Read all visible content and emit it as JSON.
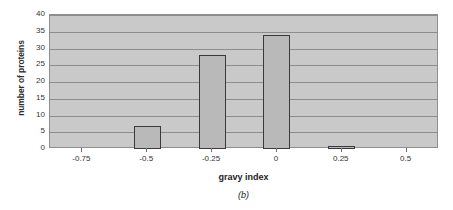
{
  "chart_data": {
    "type": "bar",
    "title": "",
    "xlabel": "gravy index",
    "ylabel": "number of proteins",
    "categories": [
      "-0.75",
      "-0.5",
      "-0.25",
      "0",
      "0.25",
      "0.5"
    ],
    "values": [
      0,
      7,
      28,
      34,
      1,
      0
    ],
    "bars": [
      {
        "category": "-0.5",
        "value": 7
      },
      {
        "category": "-0.25",
        "value": 28
      },
      {
        "category": "0",
        "value": 34
      },
      {
        "category": "0.25",
        "value": 1
      }
    ],
    "ylim": [
      0,
      40
    ],
    "ytick_labels": [
      "40",
      "35",
      "30",
      "25",
      "20",
      "15",
      "10",
      "5",
      "0"
    ],
    "ytick_values": [
      40,
      35,
      30,
      25,
      20,
      15,
      10,
      5,
      0
    ],
    "xtick_labels": [
      "-0.75",
      "-0.5",
      "-0.25",
      "0",
      "0.25",
      "0.5"
    ],
    "grid": true,
    "legend": "none",
    "colors": {
      "plot_background": "#c9c9c9",
      "gridline": "#8d8d8d",
      "bar_fill": "#b9b9b9",
      "bar_border": "#3a3a3a",
      "axis": "#8e8e8e",
      "text": "#333333"
    }
  },
  "caption": {
    "label": "(b)"
  }
}
